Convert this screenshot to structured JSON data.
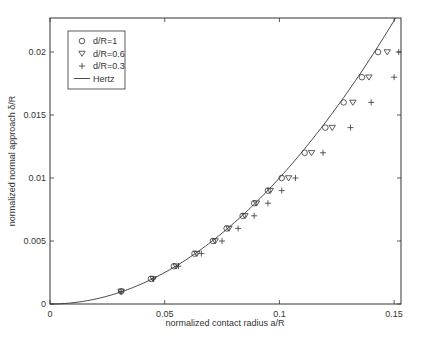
{
  "chart_data": {
    "type": "scatter",
    "title": "",
    "xlabel": "normalized contact radius a/R",
    "ylabel": "normalized normal approach δ/R",
    "xlim": [
      0,
      0.153
    ],
    "ylim": [
      0,
      0.0227
    ],
    "xticks": [
      0,
      0.05,
      0.1,
      0.15
    ],
    "xtick_labels": [
      "0",
      "0.05",
      "0.1",
      "0.15"
    ],
    "yticks": [
      0,
      0.005,
      0.01,
      0.015,
      0.02
    ],
    "ytick_labels": [
      "0",
      "0.005",
      "0.01",
      "0.015",
      "0.02"
    ],
    "grid": false,
    "legend_position": "upper left",
    "legend": [
      {
        "label": "d/R=1",
        "marker": "circle"
      },
      {
        "label": "d/R=0.6",
        "marker": "triangle-down"
      },
      {
        "label": "d/R=0.3",
        "marker": "plus"
      },
      {
        "label": "Hertz",
        "marker": "line"
      }
    ],
    "series": [
      {
        "name": "d/R=1",
        "marker": "circle",
        "x": [
          0.031,
          0.044,
          0.054,
          0.063,
          0.071,
          0.077,
          0.084,
          0.089,
          0.095,
          0.101,
          0.111,
          0.12,
          0.128,
          0.136,
          0.143
        ],
        "y": [
          0.001,
          0.002,
          0.003,
          0.004,
          0.005,
          0.006,
          0.007,
          0.008,
          0.009,
          0.01,
          0.012,
          0.014,
          0.016,
          0.018,
          0.02
        ]
      },
      {
        "name": "d/R=0.6",
        "marker": "triangle-down",
        "x": [
          0.031,
          0.045,
          0.055,
          0.064,
          0.072,
          0.078,
          0.085,
          0.09,
          0.096,
          0.104,
          0.114,
          0.123,
          0.132,
          0.139,
          0.147
        ],
        "y": [
          0.001,
          0.002,
          0.003,
          0.004,
          0.005,
          0.006,
          0.007,
          0.008,
          0.009,
          0.01,
          0.012,
          0.014,
          0.016,
          0.018,
          0.02
        ]
      },
      {
        "name": "d/R=0.3",
        "marker": "plus",
        "x": [
          0.031,
          0.045,
          0.056,
          0.066,
          0.075,
          0.082,
          0.089,
          0.095,
          0.101,
          0.107,
          0.119,
          0.131,
          0.14,
          0.15,
          0.152
        ],
        "y": [
          0.001,
          0.002,
          0.003,
          0.004,
          0.005,
          0.006,
          0.007,
          0.008,
          0.009,
          0.01,
          0.012,
          0.014,
          0.016,
          0.018,
          0.02
        ]
      },
      {
        "name": "Hertz",
        "marker": "line",
        "formula": "delta/R = (a/R)^2"
      }
    ]
  }
}
